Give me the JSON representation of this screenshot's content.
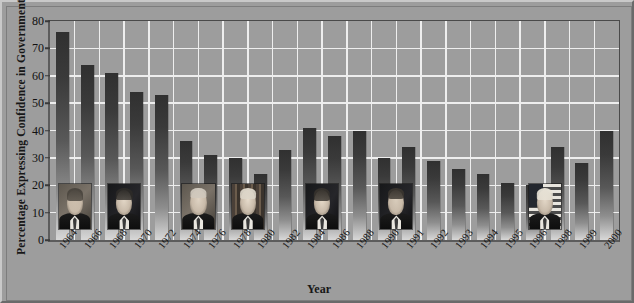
{
  "chart_data": {
    "type": "bar",
    "title": "",
    "xlabel": "Year",
    "ylabel": "Percentage Expressing Confidence in Government",
    "ylim": [
      0,
      80
    ],
    "ytick_step": 10,
    "yticks": [
      0,
      10,
      20,
      30,
      40,
      50,
      60,
      70,
      80
    ],
    "grid": true,
    "legend": "none",
    "categories": [
      "1964",
      "1966",
      "1968",
      "1970",
      "1972",
      "1974",
      "1976",
      "1978",
      "1980",
      "1982",
      "1984",
      "1986",
      "1988",
      "1990",
      "1991",
      "1992",
      "1993",
      "1994",
      "1995",
      "1996",
      "1998",
      "1999",
      "2000"
    ],
    "values": [
      76,
      64,
      61,
      54,
      53,
      36,
      31,
      30,
      24,
      33,
      41,
      38,
      40,
      30,
      34,
      29,
      26,
      24,
      21,
      20,
      34,
      28,
      40
    ],
    "series": [
      {
        "name": "Percentage Expressing Confidence in Government",
        "values": [
          76,
          64,
          61,
          54,
          53,
          36,
          31,
          30,
          24,
          33,
          41,
          38,
          40,
          30,
          34,
          29,
          26,
          24,
          21,
          20,
          34,
          28,
          40
        ]
      }
    ],
    "annotations": [
      {
        "label": "Lyndon B. Johnson",
        "span": [
          "1964",
          "1966"
        ]
      },
      {
        "label": "Richard Nixon",
        "span": [
          "1968",
          "1972"
        ]
      },
      {
        "label": "Gerald Ford",
        "span": [
          "1974",
          "1976"
        ]
      },
      {
        "label": "Jimmy Carter",
        "span": [
          "1976",
          "1980"
        ]
      },
      {
        "label": "Ronald Reagan",
        "span": [
          "1982",
          "1988"
        ]
      },
      {
        "label": "George H. W. Bush",
        "span": [
          "1990",
          "1992"
        ]
      },
      {
        "label": "Bill Clinton",
        "span": [
          "1993",
          "2000"
        ]
      }
    ]
  },
  "colors": {
    "background": "#9d9d9d",
    "plot_background": "#9d9d9d",
    "gridline": "#eeeeee",
    "bar_top": "#303030",
    "bar_bottom": "#d8d8d8",
    "axis": "#4a4a4a",
    "text": "#141414"
  },
  "axes": {
    "y_title": "Percentage Expressing Confidence in Government",
    "x_title": "Year"
  },
  "yticks": {
    "t0": "0",
    "t1": "10",
    "t2": "20",
    "t3": "30",
    "t4": "40",
    "t5": "50",
    "t6": "60",
    "t7": "70",
    "t8": "80"
  },
  "portraits": [
    {
      "name": "portrait-johnson",
      "person": "Lyndon B. Johnson"
    },
    {
      "name": "portrait-nixon",
      "person": "Richard Nixon"
    },
    {
      "name": "portrait-ford",
      "person": "Gerald Ford"
    },
    {
      "name": "portrait-carter",
      "person": "Jimmy Carter"
    },
    {
      "name": "portrait-reagan",
      "person": "Ronald Reagan"
    },
    {
      "name": "portrait-bush",
      "person": "George H. W. Bush"
    },
    {
      "name": "portrait-clinton",
      "person": "Bill Clinton"
    }
  ]
}
